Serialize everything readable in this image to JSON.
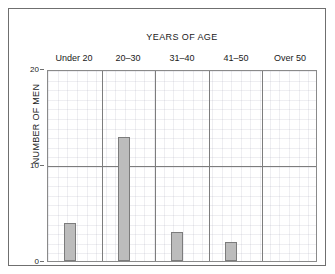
{
  "chart_data": {
    "type": "bar",
    "title": "YEARS OF AGE",
    "xlabel": "",
    "ylabel": "NUMBER OF MEN",
    "categories": [
      "Under 20",
      "20–30",
      "31–40",
      "41–50",
      "Over 50"
    ],
    "values": [
      4,
      13,
      3,
      2,
      0
    ],
    "ylim": [
      0,
      20
    ],
    "yticks": [
      0,
      10,
      20
    ],
    "ytick_labels": [
      "0",
      "10",
      "20"
    ],
    "grid": "minor-grid-visible-major-horizontal-at-10-and-vertical-category-dividers",
    "legend": "none",
    "bar_color": "#bcbcbc",
    "bar_edge_color": "#7c7c7c",
    "axis_color": "#7d7d7d",
    "frame_color": "#6f6f6f",
    "background": "#ffffff"
  },
  "axes": {
    "y_title": "NUMBER OF MEN",
    "ticks": [
      {
        "label": "20",
        "value": 20
      },
      {
        "label": "10",
        "value": 10
      },
      {
        "label": "0",
        "value": 0
      }
    ]
  }
}
